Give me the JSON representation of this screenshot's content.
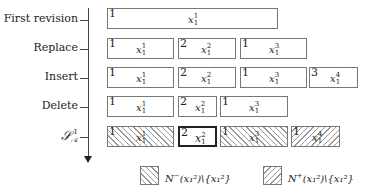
{
  "axis": {
    "direction": "down",
    "row_labels": [
      "First revision",
      "Replace",
      "Insert",
      "Delete",
      "S_A^1"
    ]
  },
  "rows": [
    {
      "label": "First revision",
      "boxes": [
        {
          "num": "1",
          "var": "x",
          "sup": "1",
          "sub": "1",
          "style": "plain"
        }
      ]
    },
    {
      "label": "Replace",
      "boxes": [
        {
          "num": "1",
          "var": "x",
          "sup": "1",
          "sub": "1",
          "style": "plain"
        },
        {
          "num": "2",
          "var": "x",
          "sup": "2",
          "sub": "1",
          "style": "plain"
        },
        {
          "num": "1",
          "var": "x",
          "sup": "3",
          "sub": "1",
          "style": "plain"
        }
      ]
    },
    {
      "label": "Insert",
      "boxes": [
        {
          "num": "1",
          "var": "x",
          "sup": "1",
          "sub": "1",
          "style": "plain"
        },
        {
          "num": "2",
          "var": "x",
          "sup": "2",
          "sub": "1",
          "style": "plain"
        },
        {
          "num": "1",
          "var": "x",
          "sup": "3",
          "sub": "1",
          "style": "plain"
        },
        {
          "num": "3",
          "var": "x",
          "sup": "4",
          "sub": "1",
          "style": "plain"
        }
      ]
    },
    {
      "label": "Delete",
      "boxes": [
        {
          "num": "1",
          "var": "x",
          "sup": "1",
          "sub": "1",
          "style": "plain"
        },
        {
          "num": "2",
          "var": "x",
          "sup": "2",
          "sub": "1",
          "style": "plain"
        },
        {
          "num": "1",
          "var": "x",
          "sup": "3",
          "sub": "1",
          "style": "plain"
        }
      ]
    },
    {
      "label": "S_A^1",
      "boxes": [
        {
          "num": "1",
          "var": "x",
          "sup": "1",
          "sub": "1",
          "style": "hatch-back"
        },
        {
          "num": "2",
          "var": "x",
          "sup": "2",
          "sub": "1",
          "style": "bold"
        },
        {
          "num": "1",
          "var": "x",
          "sup": "3",
          "sub": "1",
          "style": "hatch-back"
        },
        {
          "num": "1",
          "var": "x",
          "sup": "4",
          "sub": "1",
          "style": "hatch-fwd"
        }
      ]
    }
  ],
  "legend": [
    {
      "pattern": "hatch-back",
      "text_prefix": "N",
      "text_sup": "−",
      "text_rest": "(x₁²)\\{x₁²}"
    },
    {
      "pattern": "hatch-fwd",
      "text_prefix": "N",
      "text_sup": "+",
      "text_rest": "(x₁²)\\{x₁²}"
    }
  ]
}
